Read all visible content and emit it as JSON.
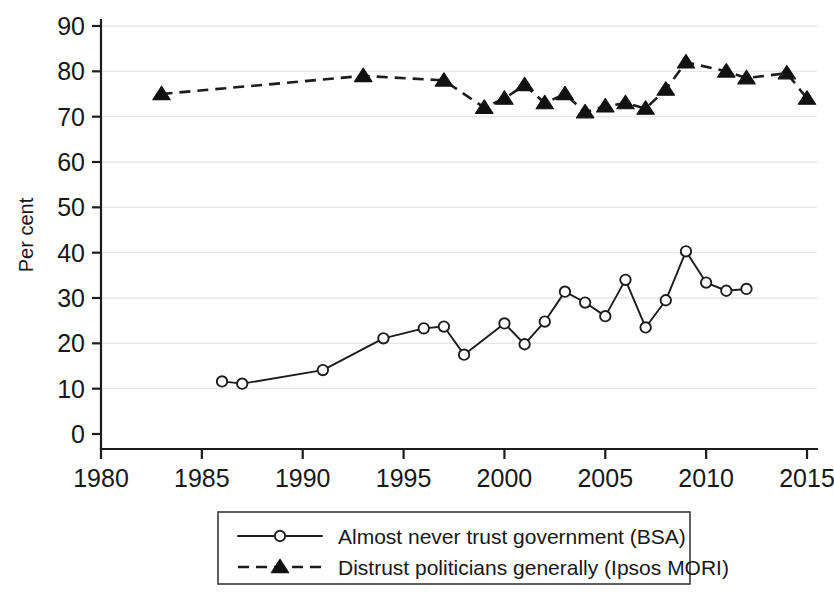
{
  "chart_data": {
    "type": "line",
    "title": "",
    "subtitle": "",
    "xlabel": "",
    "ylabel": "Per cent",
    "xlim": [
      1979,
      2016.5
    ],
    "ylim": [
      0,
      90
    ],
    "xticks": [
      "1980",
      "1985",
      "1990",
      "1995",
      "2000",
      "2005",
      "2010",
      "2015"
    ],
    "xtick_values": [
      1980,
      1985,
      1990,
      1995,
      2000,
      2005,
      2010,
      2015
    ],
    "yticks": [
      "0",
      "10",
      "20",
      "30",
      "40",
      "50",
      "60",
      "70",
      "80",
      "90"
    ],
    "ytick_values": [
      0,
      10,
      20,
      30,
      40,
      50,
      60,
      70,
      80,
      90
    ],
    "grid": "horizontal",
    "legend_position": "below-plot",
    "series": [
      {
        "name": "Almost never trust government (BSA)",
        "marker": "circle-open",
        "linestyle": "solid",
        "color": "#1c1c1c",
        "x": [
          1986,
          1987,
          1991,
          1994,
          1996,
          1997,
          1998,
          2000,
          2001,
          2002,
          2003,
          2004,
          2005,
          2006,
          2007,
          2008,
          2009,
          2010,
          2011,
          2012
        ],
        "values": [
          11.6,
          11.1,
          14.1,
          21.1,
          23.3,
          23.7,
          17.5,
          24.4,
          19.8,
          24.8,
          31.4,
          29.0,
          26.0,
          34.0,
          23.5,
          29.5,
          40.3,
          33.4,
          31.6,
          32.0
        ]
      },
      {
        "name": "Distrust politicians generally (Ipsos MORI)",
        "marker": "triangle-filled",
        "linestyle": "dashed",
        "color": "#111111",
        "x": [
          1983,
          1993,
          1997,
          1999,
          2000,
          2001,
          2002,
          2003,
          2004,
          2005,
          2006,
          2007,
          2008,
          2009,
          2011,
          2012,
          2014,
          2015
        ],
        "values": [
          75.0,
          79.0,
          78.0,
          72.0,
          74.0,
          77.0,
          73.0,
          75.0,
          71.0,
          72.3,
          73.0,
          71.8,
          76.0,
          82.0,
          80.0,
          78.5,
          79.6,
          74.0
        ]
      }
    ]
  },
  "axes": {
    "ylabel": "Per cent"
  },
  "legend": {
    "items": [
      {
        "label": "Almost never trust government (BSA)",
        "marker": "circle-open",
        "linestyle": "solid"
      },
      {
        "label": "Distrust politicians generally (Ipsos MORI)",
        "marker": "triangle-filled",
        "linestyle": "dashed"
      }
    ]
  }
}
